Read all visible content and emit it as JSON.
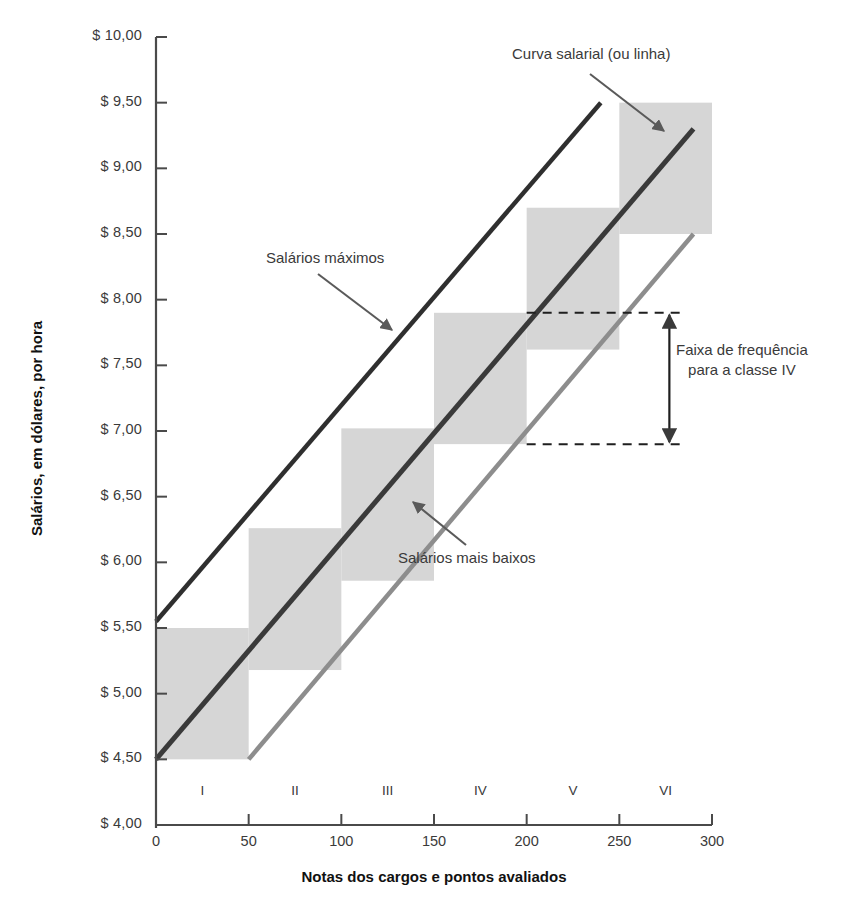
{
  "chart_data": {
    "type": "line",
    "title": "",
    "xlabel": "Notas dos cargos e pontos avaliados",
    "ylabel": "Salários, em dólares, por hora",
    "xlim": [
      0,
      300
    ],
    "ylim": [
      4.0,
      10.0
    ],
    "grid": false,
    "legend_position": "none",
    "x_ticks": [
      "0",
      "50",
      "100",
      "150",
      "200",
      "250",
      "300"
    ],
    "x_tick_values": [
      0,
      50,
      100,
      150,
      200,
      250,
      300
    ],
    "y_ticks": [
      "$ 4,00",
      "$ 4,50",
      "$ 5,00",
      "$ 5,50",
      "$ 6,00",
      "$ 6,50",
      "$ 7,00",
      "$ 7,50",
      "$ 8,00",
      "$ 8,50",
      "$ 9,00",
      "$ 9,50",
      "$ 10,00"
    ],
    "y_tick_values": [
      4.0,
      4.5,
      5.0,
      5.5,
      6.0,
      6.5,
      7.0,
      7.5,
      8.0,
      8.5,
      9.0,
      9.5,
      10.0
    ],
    "class_labels": [
      "I",
      "II",
      "III",
      "IV",
      "V",
      "VI"
    ],
    "class_label_x": [
      25,
      75,
      125,
      175,
      225,
      275
    ],
    "series": [
      {
        "name": "Salários máximos",
        "color": "#2f2f2f",
        "width": 4.5,
        "x": [
          0,
          240
        ],
        "values": [
          5.55,
          9.5
        ]
      },
      {
        "name": "Curva salarial (ou linha)",
        "color": "#3a3a3a",
        "width": 5,
        "x": [
          0,
          290
        ],
        "values": [
          4.5,
          9.3
        ]
      },
      {
        "name": "Salários mais baixos",
        "color": "#8d8d8d",
        "width": 4.5,
        "x": [
          50,
          290
        ],
        "values": [
          4.5,
          8.5
        ]
      }
    ],
    "grade_boxes": [
      {
        "label": "I",
        "x0": 0,
        "x1": 50,
        "y0": 4.5,
        "y1": 5.5
      },
      {
        "label": "II",
        "x0": 50,
        "x1": 100,
        "y0": 5.18,
        "y1": 6.26
      },
      {
        "label": "III",
        "x0": 100,
        "x1": 150,
        "y0": 5.86,
        "y1": 7.02
      },
      {
        "label": "IV",
        "x0": 150,
        "x1": 200,
        "y0": 6.9,
        "y1": 7.9
      },
      {
        "label": "V",
        "x0": 200,
        "x1": 250,
        "y0": 7.62,
        "y1": 8.7
      },
      {
        "label": "VI",
        "x0": 250,
        "x1": 300,
        "y0": 8.5,
        "y1": 9.5
      }
    ],
    "box_color": "#d6d6d6",
    "range_marker": {
      "class": "IV",
      "y_top": 7.9,
      "y_bottom": 6.9,
      "dash_x_start": 200,
      "dash_x_end": 280,
      "arrow_x": 277
    },
    "annotations": [
      {
        "id": "curva-salarial",
        "text": "Curva salarial (ou linha)",
        "x": 512,
        "y": 52,
        "align": "left"
      },
      {
        "id": "salarios-maximos",
        "text": "Salários máximos",
        "x": 266,
        "y": 255,
        "align": "left"
      },
      {
        "id": "salarios-baixos",
        "text": "Salários mais baixos",
        "x": 398,
        "y": 555,
        "align": "left"
      },
      {
        "id": "faixa-frequencia",
        "line1": "Faixa de frequência",
        "line2": "para a classe IV",
        "x": 686,
        "y": 348,
        "align": "left"
      }
    ]
  },
  "axes": {
    "x_title": "Notas dos cargos e pontos avaliados",
    "y_title": "Salários, em dólares, por hora",
    "axis_color": "#4a4a4a"
  },
  "annotation_text": {
    "curva_salarial": "Curva salarial (ou linha)",
    "salarios_maximos": "Salários máximos",
    "salarios_mais_baixos": "Salários mais baixos",
    "faixa_line1": "Faixa de frequência",
    "faixa_line2": "para a classe IV"
  }
}
